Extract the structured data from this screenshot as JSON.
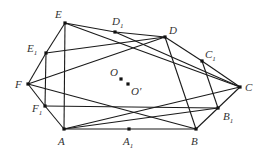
{
  "diagram": {
    "title": "",
    "points": {
      "A": {
        "x": 64,
        "y": 129,
        "label": "A",
        "sub": "",
        "lx": 58,
        "ly": 145
      },
      "A1": {
        "x": 129,
        "y": 129,
        "label": "A",
        "sub": "1",
        "lx": 123,
        "ly": 145
      },
      "B": {
        "x": 196,
        "y": 129,
        "label": "B",
        "sub": "",
        "lx": 191,
        "ly": 145
      },
      "B1": {
        "x": 218,
        "y": 108,
        "label": "B",
        "sub": "1",
        "lx": 223,
        "ly": 120
      },
      "C": {
        "x": 240,
        "y": 87,
        "label": "C",
        "sub": "",
        "lx": 245,
        "ly": 91
      },
      "C1": {
        "x": 202,
        "y": 61,
        "label": "C",
        "sub": "1",
        "lx": 205,
        "ly": 58
      },
      "D": {
        "x": 165,
        "y": 37,
        "label": "D",
        "sub": "",
        "lx": 169,
        "ly": 34
      },
      "D1": {
        "x": 115,
        "y": 32,
        "label": "D",
        "sub": "1",
        "lx": 112,
        "ly": 25
      },
      "E": {
        "x": 65,
        "y": 23,
        "label": "E",
        "sub": "",
        "lx": 55,
        "ly": 18
      },
      "E1": {
        "x": 46,
        "y": 53,
        "label": "E",
        "sub": "1",
        "lx": 27,
        "ly": 52
      },
      "F": {
        "x": 28,
        "y": 84,
        "label": "F",
        "sub": "",
        "lx": 15,
        "ly": 88
      },
      "F1": {
        "x": 45,
        "y": 106,
        "label": "F",
        "sub": "1",
        "lx": 32,
        "ly": 112
      },
      "O": {
        "x": 121,
        "y": 79,
        "label": "O",
        "sub": "",
        "lx": 110,
        "ly": 76
      },
      "O2": {
        "x": 128,
        "y": 84,
        "label": "O′",
        "sub": "",
        "lx": 131,
        "ly": 95
      }
    },
    "segments": [
      [
        "A",
        "A1"
      ],
      [
        "A1",
        "B"
      ],
      [
        "B",
        "B1"
      ],
      [
        "B1",
        "C"
      ],
      [
        "C",
        "C1"
      ],
      [
        "C1",
        "D"
      ],
      [
        "D",
        "D1"
      ],
      [
        "D1",
        "E"
      ],
      [
        "E",
        "E1"
      ],
      [
        "E1",
        "F"
      ],
      [
        "F",
        "F1"
      ],
      [
        "F1",
        "A"
      ],
      [
        "E",
        "A"
      ],
      [
        "E1",
        "F1"
      ],
      [
        "D",
        "B"
      ],
      [
        "C1",
        "B1"
      ],
      [
        "E",
        "C"
      ],
      [
        "D1",
        "C"
      ],
      [
        "E1",
        "D"
      ],
      [
        "F",
        "D"
      ],
      [
        "F",
        "B"
      ],
      [
        "F1",
        "B1"
      ],
      [
        "A",
        "C"
      ],
      [
        "A",
        "B1"
      ]
    ]
  }
}
